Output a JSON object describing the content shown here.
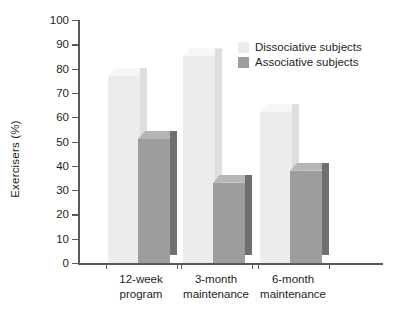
{
  "chart_data": {
    "type": "bar",
    "title": "",
    "subtitle": "",
    "xlabel": "",
    "ylabel": "Exercisers (%)",
    "ylim": [
      0,
      100
    ],
    "ytick_step": 10,
    "yticks": [
      0,
      10,
      20,
      30,
      40,
      50,
      60,
      70,
      80,
      90,
      100
    ],
    "ytick_labels": [
      "0",
      "10",
      "20",
      "30",
      "40",
      "50",
      "60",
      "70",
      "80",
      "90",
      "100"
    ],
    "grid": false,
    "legend_position": "top-right",
    "categories": [
      "12-week\nprogram",
      "3-month\nmaintenance",
      "6-month\nmaintenance"
    ],
    "category_lines": [
      [
        "12-week",
        "program"
      ],
      [
        "3-month",
        "maintenance"
      ],
      [
        "6-month",
        "maintenance"
      ]
    ],
    "series": [
      {
        "name": "Dissociative subjects",
        "color": "#ececec",
        "values": [
          77,
          85,
          62
        ]
      },
      {
        "name": "Associative subjects",
        "color": "#9d9d9d",
        "values": [
          51,
          33,
          38
        ]
      }
    ]
  },
  "legend": {
    "items": [
      {
        "label": "Dissociative subjects",
        "color": "#ececec"
      },
      {
        "label": "Associative subjects",
        "color": "#9d9d9d"
      }
    ]
  },
  "axis": {
    "y_title": "Exercisers (%)",
    "axis_color": "#58595b"
  }
}
